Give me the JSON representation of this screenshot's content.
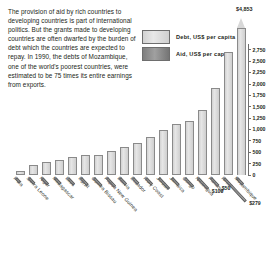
{
  "intro": {
    "text": "The provision of aid by rich countries to developing countries is part of international politics. But the grants made to developing countries are often dwarfed by the burden of debt which the countries are expected to repay. In 1990, the debts of Mozambique, one of the world's poorest countries, were estimated to be 75 times its entire earnings from exports."
  },
  "legend": {
    "items": [
      {
        "label": "Debt, US$ per capita",
        "color": "#dcdcdc"
      },
      {
        "label": "Aid, US$ per capita",
        "color": "#8d8d8d"
      }
    ]
  },
  "chart_data": {
    "type": "bar",
    "title": "",
    "xlabel": "",
    "ylabel": "US$ per capita",
    "ylim": [
      0,
      2875
    ],
    "grid": false,
    "legend_position": "top-right",
    "peak_label": "$4,853",
    "peak_note": "Mozambique debt exceeds the axis scale and is drawn as a broken, arrow-topped bar.",
    "yticks": [
      0,
      250,
      500,
      750,
      1000,
      1250,
      1500,
      1750,
      2000,
      2250,
      2500,
      2750
    ],
    "ytick_labels": [
      "0",
      "250",
      "500",
      "750",
      "1,000",
      "1,250",
      "1,500",
      "1,750",
      "2,000",
      "2,250",
      "2,500",
      "2,750"
    ],
    "categories": [
      "India",
      "Sierra Leone",
      "Niger",
      "Madagascar",
      "Laos",
      "Egypt",
      "Guinea Bissau",
      "Papua New Guinea",
      "Bolivia",
      "Ecuador",
      "Ivory Coast",
      "Jordan",
      "Jamaica",
      "Congo",
      "Nicaragua",
      "Panama",
      "Israel",
      "Mozambique"
    ],
    "series": [
      {
        "name": "Debt, US$ per capita",
        "values": [
          80,
          230,
          280,
          330,
          400,
          430,
          450,
          520,
          620,
          700,
          830,
          980,
          1120,
          1180,
          1420,
          1900,
          2700,
          4853
        ]
      },
      {
        "name": "Aid, US$ per capita",
        "values": [
          3,
          18,
          28,
          22,
          30,
          40,
          55,
          60,
          35,
          20,
          28,
          95,
          45,
          60,
          100,
          50,
          279,
          30
        ]
      }
    ],
    "annotations": [
      {
        "text": "$100",
        "series": "Aid, US$ per capita",
        "category": "Nicaragua"
      },
      {
        "text": "$279",
        "series": "Aid, US$ per capita",
        "category": "Israel"
      },
      {
        "text": "$50",
        "series": "Aid, US$ per capita",
        "category": "Panama"
      }
    ]
  }
}
